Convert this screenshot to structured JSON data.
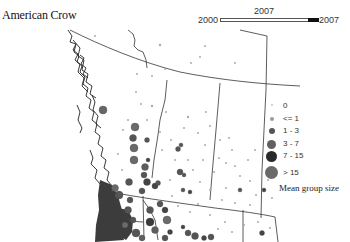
{
  "title": "American Crow",
  "time_slider": {
    "min_label": "2000",
    "max_label": "2007",
    "current_label": "2007",
    "current_value": 2007
  },
  "legend": {
    "caption": "Mean group size",
    "items": [
      {
        "label": "0",
        "size": 2,
        "color": "#c8c8c8"
      },
      {
        "label": "<= 1",
        "size": 4,
        "color": "#9a9a9a"
      },
      {
        "label": "1 - 3",
        "size": 6,
        "color": "#555555"
      },
      {
        "label": "3 - 7",
        "size": 9,
        "color": "#606060"
      },
      {
        "label": "7 - 15",
        "size": 11,
        "color": "#2a2a2a"
      },
      {
        "label": "> 15",
        "size": 13,
        "color": "#6a6a6a"
      }
    ]
  },
  "colors": {
    "border_line": "#333333",
    "coast_line": "#222222",
    "dense_fill": "#3c3c3c"
  }
}
